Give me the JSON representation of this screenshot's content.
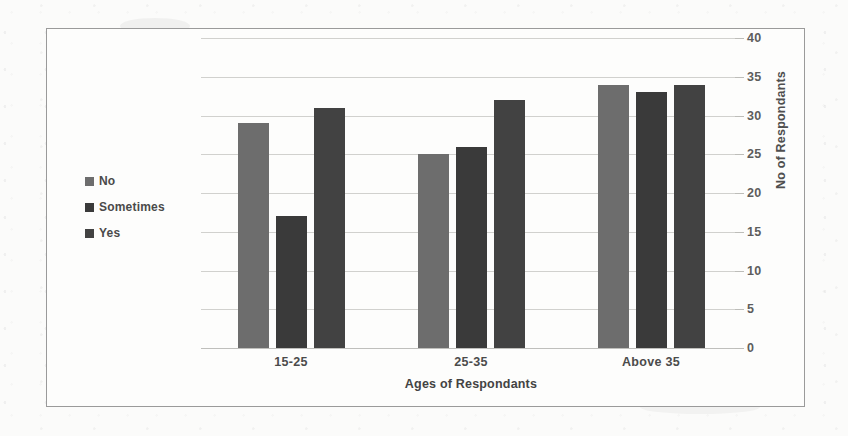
{
  "chart_data": {
    "type": "bar",
    "title": "",
    "xlabel": "Ages of Respondants",
    "ylabel": "No of Respondants",
    "categories": [
      "15-25",
      "25-35",
      "Above 35"
    ],
    "series": [
      {
        "name": "No",
        "values": [
          29,
          25,
          34
        ],
        "color": "#6d6d6d"
      },
      {
        "name": "Sometimes",
        "values": [
          17,
          26,
          33
        ],
        "color": "#3a3a3a"
      },
      {
        "name": "Yes",
        "values": [
          31,
          32,
          34
        ],
        "color": "#424242"
      }
    ],
    "ylim": [
      0,
      40
    ],
    "yticks": [
      40,
      35,
      30,
      25,
      20,
      15,
      10,
      5,
      0
    ],
    "grid": true,
    "legend_position": "left"
  },
  "legend": {
    "items": [
      {
        "label": "No"
      },
      {
        "label": "Sometimes"
      },
      {
        "label": "Yes"
      }
    ]
  },
  "axes": {
    "y_title": "No of Respondants",
    "x_title": "Ages of Respondants"
  }
}
